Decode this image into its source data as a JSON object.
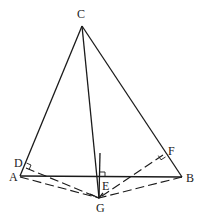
{
  "diagram": {
    "type": "geometry",
    "points": {
      "C": {
        "label": "C",
        "x": 82,
        "y": 26,
        "lx": 77,
        "ly": 18
      },
      "A": {
        "label": "A",
        "x": 20,
        "y": 176,
        "lx": 9,
        "ly": 181
      },
      "B": {
        "label": "B",
        "x": 182,
        "y": 177,
        "lx": 186,
        "ly": 182
      },
      "D": {
        "label": "D",
        "x": 26,
        "y": 165,
        "lx": 15,
        "ly": 166
      },
      "F": {
        "label": "F",
        "x": 163,
        "y": 153,
        "lx": 169,
        "ly": 154
      },
      "E": {
        "label": "E",
        "x": 100,
        "y": 177,
        "lx": 103,
        "ly": 190
      },
      "G": {
        "label": "G",
        "x": 99,
        "y": 198,
        "lx": 96,
        "ly": 212
      }
    },
    "labels": {
      "C": "C",
      "A": "A",
      "B": "B",
      "D": "D",
      "E": "E",
      "F": "F",
      "G": "G"
    },
    "solid_segments": [
      "CA",
      "CB",
      "AB",
      "CG",
      "E-perpendicular"
    ],
    "dashed_segments": [
      "AG",
      "BG",
      "DG",
      "FG"
    ],
    "right_angles": [
      "D",
      "E",
      "F"
    ],
    "stroke_color": "#1a1a1a",
    "background": "#ffffff"
  }
}
